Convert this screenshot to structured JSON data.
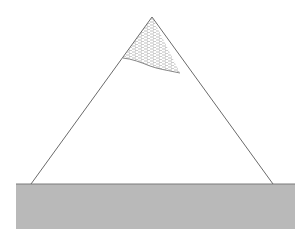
{
  "diagram": {
    "type": "mountain-illustration",
    "background": "#ffffff",
    "mountain": {
      "apex": [
        152,
        17
      ],
      "base_left": [
        31,
        184
      ],
      "base_right": [
        273,
        184
      ],
      "stroke": "#6a6a6a",
      "stroke_width": 1
    },
    "snow_cap": {
      "boundary": [
        [
          152,
          17
        ],
        [
          123,
          58
        ],
        [
          135,
          60
        ],
        [
          150,
          66
        ],
        [
          162,
          69
        ],
        [
          175,
          72
        ],
        [
          180,
          73
        ]
      ],
      "hatch_color": "#9a9a9a",
      "hatch_pattern": "horizontal-dashed"
    },
    "ground": {
      "x": 16,
      "y": 184,
      "width": 279,
      "height": 45,
      "fill": "#b8b8b8",
      "top_edge": "#7a7a7a"
    }
  }
}
